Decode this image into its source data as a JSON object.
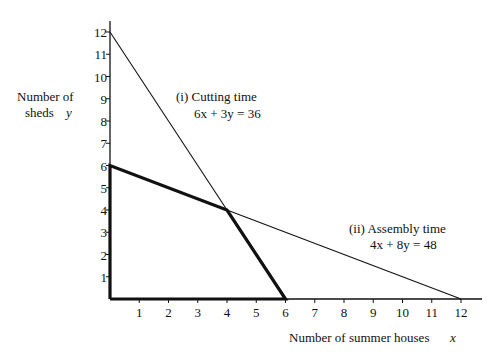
{
  "chart_data": {
    "type": "line",
    "title": "",
    "xlabel": "Number of summer houses",
    "xlabel_var": "x",
    "ylabel_line1": "Number of",
    "ylabel_line2": "sheds",
    "ylabel_var": "y",
    "xlim": [
      0,
      12
    ],
    "ylim": [
      0,
      12
    ],
    "xticks": [
      1,
      2,
      3,
      4,
      5,
      6,
      7,
      8,
      9,
      10,
      11,
      12
    ],
    "yticks": [
      1,
      2,
      3,
      4,
      5,
      6,
      7,
      8,
      9,
      10,
      11,
      12
    ],
    "grid": false,
    "series": [
      {
        "name": "(i) Cutting time",
        "equation": "6x + 3y = 36",
        "points": [
          [
            0,
            12
          ],
          [
            6,
            0
          ]
        ],
        "style": "thin"
      },
      {
        "name": "(ii) Assembly time",
        "equation": "4x + 8y = 48",
        "points": [
          [
            0,
            6
          ],
          [
            12,
            0
          ]
        ],
        "style": "thin"
      },
      {
        "name": "Feasible region boundary",
        "points": [
          [
            0,
            0
          ],
          [
            0,
            6
          ],
          [
            4,
            4
          ],
          [
            6,
            0
          ],
          [
            0,
            0
          ]
        ],
        "style": "bold"
      }
    ],
    "annotations": [
      {
        "text": "(i) Cutting time",
        "sub": "6x + 3y = 36"
      },
      {
        "text": "(ii) Assembly time",
        "sub": "4x + 8y = 48"
      }
    ]
  }
}
